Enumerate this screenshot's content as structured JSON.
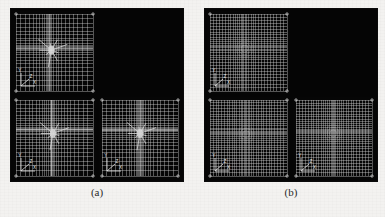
{
  "page": {
    "background_color": "#f3f2f0",
    "ink_color": "#2a2a2a"
  },
  "figure": {
    "type": "adaptive-finite-element-mesh-comparison",
    "panel_background": "#050505",
    "mesh_line_color": "#d8d8d8",
    "subfigures": [
      {
        "id": "a",
        "caption": "(a)",
        "quadrants": [
          {
            "position": "top-left",
            "content": "mesh",
            "refinement_pattern": "star-spike",
            "grid_divisions": 26,
            "refine_center_x": 0.46,
            "refine_center_y": 0.47,
            "refine_strength": 0.62,
            "has_axis_triad": true,
            "has_corner_ticks": true
          },
          {
            "position": "top-right",
            "content": "blank",
            "refinement_pattern": "none",
            "has_axis_triad": false,
            "has_corner_ticks": false
          },
          {
            "position": "bottom-left",
            "content": "mesh",
            "refinement_pattern": "star-spike",
            "grid_divisions": 28,
            "refine_center_x": 0.48,
            "refine_center_y": 0.44,
            "refine_strength": 0.66,
            "has_axis_triad": true,
            "has_corner_ticks": true
          },
          {
            "position": "bottom-right",
            "content": "mesh",
            "refinement_pattern": "star-spike",
            "grid_divisions": 28,
            "refine_center_x": 0.5,
            "refine_center_y": 0.44,
            "refine_strength": 0.64,
            "has_axis_triad": true,
            "has_corner_ticks": true
          }
        ]
      },
      {
        "id": "b",
        "caption": "(b)",
        "quadrants": [
          {
            "position": "top-left",
            "content": "mesh",
            "refinement_pattern": "circular-cluster",
            "grid_divisions": 30,
            "refine_center_x": 0.45,
            "refine_center_y": 0.45,
            "refine_strength": 0.34,
            "has_axis_triad": true,
            "has_corner_ticks": true
          },
          {
            "position": "top-right",
            "content": "blank",
            "refinement_pattern": "none",
            "has_axis_triad": false,
            "has_corner_ticks": false
          },
          {
            "position": "bottom-left",
            "content": "mesh",
            "refinement_pattern": "circular-cluster",
            "grid_divisions": 32,
            "refine_center_x": 0.47,
            "refine_center_y": 0.45,
            "refine_strength": 0.3,
            "has_axis_triad": true,
            "has_corner_ticks": true
          },
          {
            "position": "bottom-right",
            "content": "mesh",
            "refinement_pattern": "circular-cluster",
            "grid_divisions": 32,
            "refine_center_x": 0.49,
            "refine_center_y": 0.44,
            "refine_strength": 0.36,
            "has_axis_triad": true,
            "has_corner_ticks": true
          }
        ]
      }
    ]
  },
  "axis_triad": {
    "labels": [
      "X",
      "Y",
      "Z"
    ],
    "color": "#e6e6e6"
  },
  "scan_artifacts": {
    "bleed_line_1": "",
    "bleed_line_2": ""
  }
}
